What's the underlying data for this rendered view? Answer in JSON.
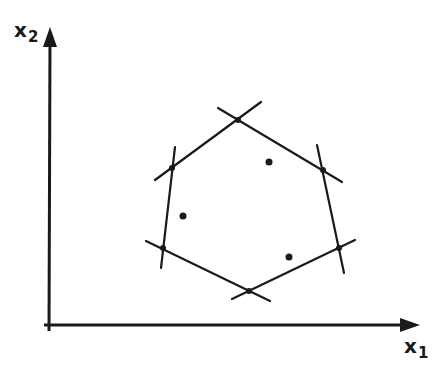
{
  "axes": {
    "x_label": "x",
    "x_subscript": "1",
    "y_label": "x",
    "y_subscript": "2",
    "origin": [
      49,
      325
    ],
    "x_end": [
      420,
      325
    ],
    "y_end": [
      50,
      27
    ]
  },
  "colors": {
    "ink": "#1a1a1a",
    "background": "#ffffff"
  },
  "hexagon": {
    "vertices": [
      {
        "name": "top",
        "x": 238,
        "y": 120
      },
      {
        "name": "upper-right",
        "x": 323,
        "y": 170
      },
      {
        "name": "lower-right",
        "x": 339,
        "y": 248
      },
      {
        "name": "bottom",
        "x": 249,
        "y": 291
      },
      {
        "name": "lower-left",
        "x": 163,
        "y": 248
      },
      {
        "name": "upper-left",
        "x": 172,
        "y": 168
      }
    ],
    "edges": [
      {
        "from": [
          155,
          180
        ],
        "to": [
          261,
          102
        ]
      },
      {
        "from": [
          218,
          108
        ],
        "to": [
          342,
          182
        ]
      },
      {
        "from": [
          317,
          145
        ],
        "to": [
          344,
          273
        ]
      },
      {
        "from": [
          355,
          240
        ],
        "to": [
          232,
          299
        ]
      },
      {
        "from": [
          270,
          301
        ],
        "to": [
          146,
          241
        ]
      },
      {
        "from": [
          161,
          268
        ],
        "to": [
          175,
          147
        ]
      }
    ]
  },
  "interior_points": [
    {
      "x": 269,
      "y": 162
    },
    {
      "x": 183,
      "y": 216
    },
    {
      "x": 289,
      "y": 257
    }
  ]
}
